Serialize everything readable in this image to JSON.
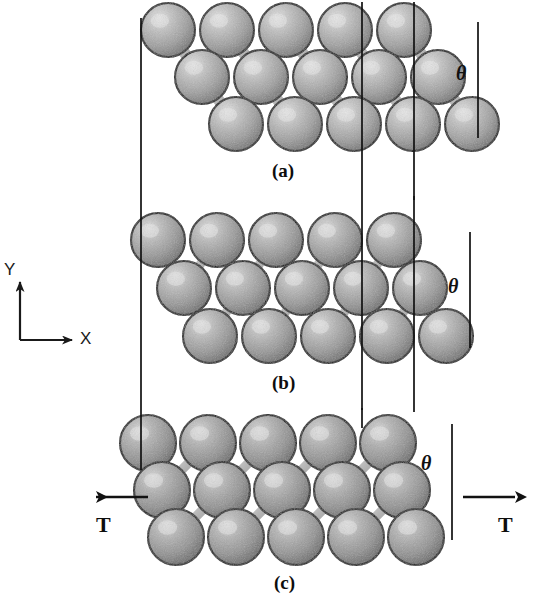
{
  "figure": {
    "kind": "atomistic-lattice-schematic",
    "background_color": "#ffffff",
    "ink_color": "#111111",
    "width": 539,
    "height": 605
  },
  "axes": {
    "name": "coordinate-axes",
    "x_label": "X",
    "y_label": "Y",
    "origin": {
      "x": 20,
      "y": 340
    },
    "x_arrow_end": {
      "x": 72,
      "y": 340
    },
    "y_arrow_end": {
      "x": 20,
      "y": 282
    }
  },
  "panels": [
    {
      "id": "a",
      "caption": "(a)",
      "caption_pos": {
        "x": 272,
        "y": 160
      },
      "theta_label": "θ",
      "theta_pos": {
        "x": 456,
        "y": 62
      },
      "rows": 3,
      "columns": 5,
      "row_offset_x": 34,
      "atom_radius": 27,
      "atom_fill": "#a8a8a8",
      "atom_highlight": "#d9d9d9",
      "atom_edge": "#1a1a1a",
      "tilt_angle_deg": 52,
      "guide_lines": [
        {
          "name": "guide-left",
          "x": 141,
          "y1": 18,
          "y2": 200
        },
        {
          "name": "guide-mid",
          "x": 362,
          "y1": 2,
          "y2": 200
        },
        {
          "name": "guide-right",
          "x": 414,
          "y1": 2,
          "y2": 200
        },
        {
          "name": "theta-line",
          "x": 478,
          "y1": 22,
          "y2": 138
        }
      ]
    },
    {
      "id": "b",
      "caption": "(b)",
      "caption_pos": {
        "x": 272,
        "y": 372
      },
      "theta_label": "θ",
      "theta_pos": {
        "x": 448,
        "y": 275
      },
      "rows": 3,
      "columns": 5,
      "row_offset_x": 26,
      "atom_radius": 27,
      "atom_fill": "#9e9e9e",
      "atom_highlight": "#d4d4d4",
      "atom_edge": "#1a1a1a",
      "tilt_angle_deg": 62,
      "guide_lines": [
        {
          "name": "guide-left",
          "x": 141,
          "y1": 200,
          "y2": 410
        },
        {
          "name": "guide-mid",
          "x": 362,
          "y1": 200,
          "y2": 410
        },
        {
          "name": "guide-right",
          "x": 414,
          "y1": 196,
          "y2": 412
        },
        {
          "name": "theta-line",
          "x": 470,
          "y1": 232,
          "y2": 348
        }
      ]
    },
    {
      "id": "c",
      "caption": "(c)",
      "caption_pos": {
        "x": 274,
        "y": 572
      },
      "theta_label": "θ",
      "theta_pos": {
        "x": 421,
        "y": 452
      },
      "rows": 3,
      "columns": 5,
      "row_offset_x": 14,
      "atom_radius": 28,
      "atom_fill": "#9a9a9a",
      "atom_highlight": "#cfcfcf",
      "atom_edge": "#1a1a1a",
      "tilt_angle_deg": 76,
      "guide_lines": [
        {
          "name": "guide-left",
          "x": 141,
          "y1": 410,
          "y2": 470
        },
        {
          "name": "guide-mid",
          "x": 362,
          "y1": 408,
          "y2": 428
        },
        {
          "name": "theta-line",
          "x": 452,
          "y1": 424,
          "y2": 540
        }
      ]
    }
  ],
  "forces": [
    {
      "name": "tension-left",
      "label": "T",
      "direction": "left",
      "arrow": {
        "x_tail": 148,
        "x_head": 96,
        "y": 497
      },
      "label_pos": {
        "x": 96,
        "y": 512
      }
    },
    {
      "name": "tension-right",
      "label": "T",
      "direction": "right",
      "arrow": {
        "x_tail": 463,
        "x_head": 515,
        "y": 497
      },
      "label_pos": {
        "x": 498,
        "y": 512
      }
    }
  ]
}
